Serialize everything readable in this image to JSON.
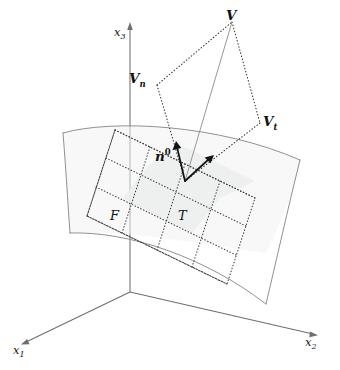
{
  "figure": {
    "type": "vector-decomposition-on-surface"
  },
  "axes": {
    "x1": {
      "label": "x",
      "sub": "1"
    },
    "x2": {
      "label": "x",
      "sub": "2"
    },
    "x3": {
      "label": "x",
      "sub": "3"
    }
  },
  "labels": {
    "vector_v": {
      "main": "V",
      "sub": "",
      "sup": ""
    },
    "vector_vn": {
      "main": "V",
      "sub": "n",
      "sup": ""
    },
    "vector_vt": {
      "main": "V",
      "sub": "t",
      "sup": ""
    },
    "normal_unit": {
      "main": "n",
      "sub": "",
      "sup": "0"
    },
    "surface_f": "F",
    "tangent_t": "T"
  },
  "colors": {
    "axis": "#6e6e6e",
    "surface_edge": "#8a8a8a",
    "surface_fill": "#f2f2f2",
    "tangent_cell": "#eceded",
    "dotted": "#2f2f2f",
    "vector": "#141414",
    "resultant": "#8c8c8c",
    "background": "#ffffff"
  },
  "geometry": {
    "origin": [
      130,
      292
    ],
    "point_p": [
      185,
      181
    ],
    "v_tip": [
      232,
      22
    ],
    "vn_node": [
      157,
      85
    ],
    "vt_node": [
      260,
      123
    ]
  }
}
